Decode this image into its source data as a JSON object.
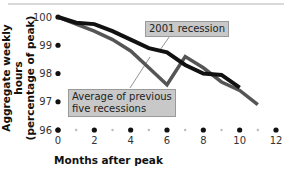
{
  "chart_data": {
    "type": "line",
    "title": "",
    "xlabel": "Months after peak",
    "ylabel": "Aggregate weekly hours (percentage of peak)",
    "ylabel_lines": [
      "Aggregate weekly hours",
      "(percentage of peak)"
    ],
    "xlim": [
      0,
      12
    ],
    "ylim": [
      96,
      100
    ],
    "x_ticks": [
      0,
      2,
      4,
      6,
      8,
      10,
      12
    ],
    "y_ticks": [
      96,
      97,
      98,
      99,
      100
    ],
    "grid": false,
    "series": [
      {
        "name": "2001 recession",
        "color": "#111111",
        "x": [
          0,
          1,
          2,
          3,
          4,
          5,
          6,
          7,
          8,
          9,
          10
        ],
        "values": [
          100,
          99.8,
          99.75,
          99.5,
          99.2,
          98.9,
          98.75,
          98.3,
          98.0,
          97.95,
          97.5
        ]
      },
      {
        "name": "Average of previous five recessions",
        "color": "#555555",
        "x": [
          0,
          1,
          2,
          3,
          4,
          5,
          6,
          7,
          8,
          9,
          10,
          11
        ],
        "values": [
          100,
          99.75,
          99.5,
          99.2,
          98.8,
          98.2,
          97.6,
          98.6,
          98.2,
          97.7,
          97.4,
          96.9
        ]
      }
    ],
    "annotations": [
      {
        "text": "2001 recession",
        "target_series": 0
      },
      {
        "text": "Average of previous five recessions",
        "lines": [
          "Average of previous",
          "five recessions"
        ],
        "target_series": 1
      }
    ]
  }
}
